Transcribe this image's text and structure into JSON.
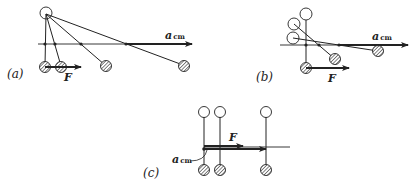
{
  "panels": {
    "a": {
      "label": "(a)",
      "force_label": "F",
      "accel_label_main": "a",
      "accel_label_sub": "cm"
    },
    "b": {
      "label": "(b)",
      "force_label": "F",
      "accel_label_main": "a",
      "accel_label_sub": "cm"
    },
    "c": {
      "label": "(c)",
      "force_label": "F",
      "accel_label_main": "a",
      "accel_label_sub": "cm"
    }
  },
  "colors": {
    "stroke": "#222222",
    "background": "#ffffff"
  }
}
